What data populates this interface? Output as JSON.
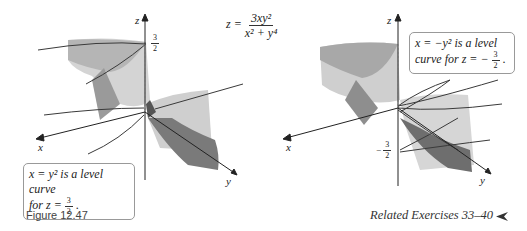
{
  "equation": {
    "lhs": "z =",
    "numerator": "3xy²",
    "denominator": "x² + y⁴"
  },
  "left_plot": {
    "axes": {
      "z": "z",
      "x": "x",
      "y": "y"
    },
    "tick": {
      "num": "3",
      "den": "2",
      "sign": ""
    },
    "callout": {
      "line1": "x = y² is a level curve",
      "line2_prefix": "for z = ",
      "frac_num": "3",
      "frac_den": "2",
      "suffix": "."
    }
  },
  "right_plot": {
    "axes": {
      "z": "z",
      "x": "x",
      "y": "y"
    },
    "tick": {
      "num": "3",
      "den": "2",
      "sign": "−"
    },
    "callout": {
      "line1": "x = −y² is a level",
      "line2_prefix": "curve for z = −",
      "frac_num": "3",
      "frac_den": "2",
      "suffix": "."
    }
  },
  "caption": "Figure 12.47",
  "related": {
    "text": "Related Exercises 33–40",
    "icon": "arrowhead-left-icon"
  },
  "colors": {
    "surface_light": "#d2d2d2",
    "surface_mid": "#a9a9a9",
    "surface_dark": "#6f6f6f",
    "line": "#3a3a3a"
  }
}
